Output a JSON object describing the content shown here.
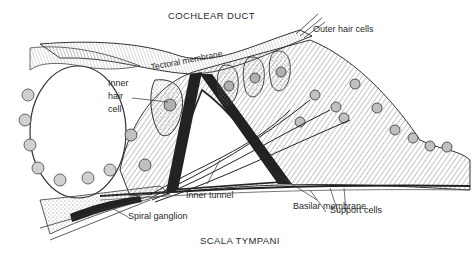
{
  "diagram": {
    "type": "anatomical-illustration",
    "region_labels": {
      "top": "COCHLEAR DUCT",
      "bottom": "SCALA TYMPANI"
    },
    "labels": {
      "outer_hair_cells": "Outer hair cells",
      "tectorial_membrane": "Tectoral membrane",
      "inner_hair_cell": [
        "Inner",
        "hair",
        "cell"
      ],
      "inner_tunnel": "Inner tunnel",
      "support_cells": "Support cells",
      "basilar_membrane": "Basilar membrane",
      "spiral_ganglion": "Spiral ganglion"
    },
    "colors": {
      "ink": "#2a2a2a",
      "background": "#ffffff",
      "hatch": "#7a7a7a",
      "cell_fill": "#c8c8c8"
    }
  }
}
